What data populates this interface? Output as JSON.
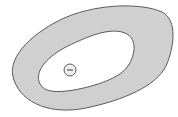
{
  "diagram": {
    "type": "annular-blob",
    "colors": {
      "background": "#ffffff",
      "ring_fill": "#d0d0d0",
      "ring_stroke": "#5a5a5a",
      "inner_fill": "#ffffff",
      "charge_stroke": "#5a5a5a",
      "charge_fill": "#eeeeee"
    },
    "charge": {
      "symbol": "minus",
      "label": ""
    }
  }
}
